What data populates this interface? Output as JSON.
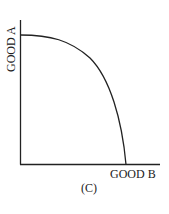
{
  "diagram": {
    "type": "production-possibilities-frontier",
    "y_axis_label": "GOOD A",
    "x_axis_label": "GOOD B",
    "caption": "(C)",
    "curve": "concave (bowed outward)",
    "line_color": "#222222",
    "background": "#ffffff"
  }
}
